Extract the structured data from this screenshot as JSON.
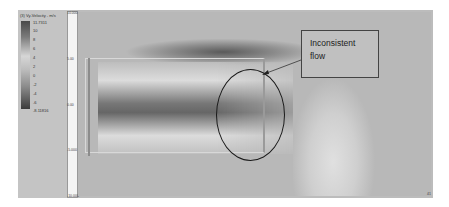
{
  "figure": {
    "legend": {
      "title": "(3) Vy-Velocity - m/s",
      "max_label": "11.7311",
      "ticks": [
        "10",
        "8",
        "6",
        "4",
        "2",
        "0",
        "-2",
        "-4",
        "-6"
      ],
      "min_label": "-8.11816"
    },
    "axis": {
      "labels": [
        "10.000",
        "5.00",
        "0.00",
        "-5.000",
        "-10.000"
      ],
      "right_corner_label": "41"
    },
    "annotation": {
      "text_line1": "Inconsistent",
      "text_line2": "flow"
    },
    "colors": {
      "background": "#bcbcbc",
      "dark_region": "#5a5a5a",
      "light_region": "#e0e0e0",
      "annotation_border": "#444444",
      "ellipse_stroke": "#1a1a1a"
    }
  }
}
